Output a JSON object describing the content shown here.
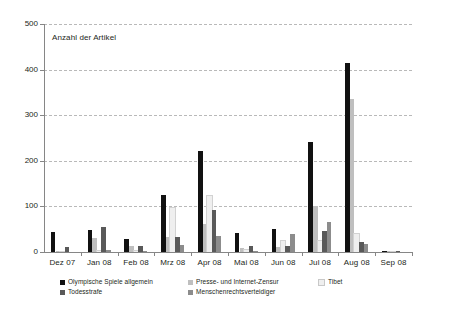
{
  "chart_data": {
    "type": "bar",
    "title": "",
    "axis_title_in_plot": "Anzahl der Artikel",
    "xlabel": "",
    "ylabel": "Anzahl der Artikel",
    "ylim": [
      0,
      500
    ],
    "yticks": [
      0,
      100,
      200,
      300,
      400,
      500
    ],
    "ytick_labels": [
      "0",
      "100",
      "200",
      "300",
      "400",
      "500"
    ],
    "grid": true,
    "grid_style": "dashed horizontal",
    "legend_position": "bottom",
    "categories": [
      "Dez 07",
      "Jan 08",
      "Feb 08",
      "Mrz 08",
      "Apr 08",
      "Mai 08",
      "Jun 08",
      "Jul 08",
      "Aug 08",
      "Sep 08"
    ],
    "series": [
      {
        "name": "Olympische Spiele allgemein",
        "color": "#111111",
        "values": [
          44,
          48,
          29,
          126,
          221,
          41,
          50,
          241,
          415,
          2
        ]
      },
      {
        "name": "Presse- und Internet-Zensur",
        "color": "#bfbfbf",
        "values": [
          1,
          31,
          13,
          34,
          62,
          9,
          10,
          100,
          336,
          1
        ]
      },
      {
        "name": "Tibet",
        "color": "#efefef",
        "values": [
          0,
          2,
          1,
          97,
          123,
          5,
          25,
          24,
          40,
          0
        ]
      },
      {
        "name": "Todesstrafe",
        "color": "#595959",
        "values": [
          11,
          54,
          14,
          32,
          93,
          14,
          14,
          45,
          22,
          1
        ]
      },
      {
        "name": "Menschenrechtsverteidiger",
        "color": "#8c8c8c",
        "values": [
          0,
          4,
          3,
          16,
          36,
          3,
          40,
          65,
          18,
          0
        ]
      }
    ]
  },
  "legend": {
    "entries": [
      {
        "label": "Olympische Spiele allgemein",
        "color": "#111111"
      },
      {
        "label": "Presse- und Internet-Zensur",
        "color": "#bfbfbf"
      },
      {
        "label": "Tibet",
        "color": "#efefef"
      },
      {
        "label": "Todesstrafe",
        "color": "#595959"
      },
      {
        "label": "Menschenrechtsverteidiger",
        "color": "#8c8c8c"
      }
    ]
  },
  "style": {
    "axis_color": "#868686",
    "grid_color": "#b9b9b9",
    "text_color": "#231f20",
    "background": "#ffffff"
  }
}
